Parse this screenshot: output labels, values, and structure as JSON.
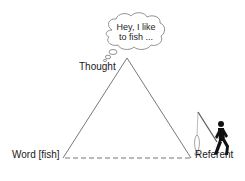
{
  "diagram": {
    "type": "semiotic-triangle",
    "nodes": {
      "thought": {
        "label": "Thought"
      },
      "word": {
        "label": "Word [fish]"
      },
      "referent": {
        "label": "Referent"
      }
    },
    "thought_bubble": {
      "line1": "Hey, I like",
      "line2": "to fish ..."
    },
    "edges": [
      {
        "from": "word",
        "to": "thought",
        "style": "solid"
      },
      {
        "from": "thought",
        "to": "referent",
        "style": "solid"
      },
      {
        "from": "word",
        "to": "referent",
        "style": "dashed"
      }
    ],
    "icons": {
      "referent": "person-fishing-icon"
    },
    "colors": {
      "stroke": "#555555",
      "figure": "#111111",
      "text": "#1a1a1a"
    }
  }
}
